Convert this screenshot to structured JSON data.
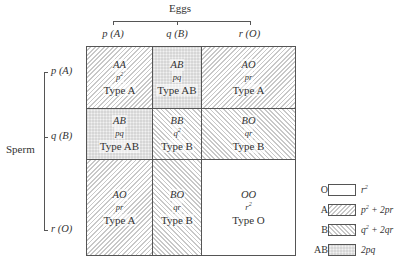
{
  "header": {
    "eggs_label": "Eggs",
    "columns": [
      {
        "freq": "p",
        "allele": "(A)"
      },
      {
        "freq": "q",
        "allele": "(B)"
      },
      {
        "freq": "r",
        "allele": "(O)"
      }
    ]
  },
  "sperm": {
    "label": "Sperm",
    "rows": [
      {
        "freq": "p",
        "allele": "(A)"
      },
      {
        "freq": "q",
        "allele": "(B)"
      },
      {
        "freq": "r",
        "allele": "(O)"
      }
    ]
  },
  "grid": {
    "cells": [
      [
        {
          "genotype": "AA",
          "freq_base": "p",
          "freq_sup": "2",
          "type": "Type A",
          "pattern": "A"
        },
        {
          "genotype": "AB",
          "freq_base": "pq",
          "freq_sup": "",
          "type": "Type AB",
          "pattern": "AB"
        },
        {
          "genotype": "AO",
          "freq_base": "pr",
          "freq_sup": "",
          "type": "Type A",
          "pattern": "A"
        }
      ],
      [
        {
          "genotype": "AB",
          "freq_base": "pq",
          "freq_sup": "",
          "type": "Type AB",
          "pattern": "AB"
        },
        {
          "genotype": "BB",
          "freq_base": "q",
          "freq_sup": "2",
          "type": "Type B",
          "pattern": "B"
        },
        {
          "genotype": "BO",
          "freq_base": "qr",
          "freq_sup": "",
          "type": "Type B",
          "pattern": "B"
        }
      ],
      [
        {
          "genotype": "AO",
          "freq_base": "pr",
          "freq_sup": "",
          "type": "Type A",
          "pattern": "A"
        },
        {
          "genotype": "BO",
          "freq_base": "qr",
          "freq_sup": "",
          "type": "Type B",
          "pattern": "B"
        },
        {
          "genotype": "OO",
          "freq_base": "r",
          "freq_sup": "2",
          "type": "Type O",
          "pattern": "O"
        }
      ]
    ]
  },
  "legend": {
    "items": [
      {
        "key": "O",
        "pattern": "O",
        "formula_parts": [
          "r",
          "2",
          ""
        ]
      },
      {
        "key": "A",
        "pattern": "A",
        "formula_parts": [
          "p",
          "2",
          " + 2pr"
        ]
      },
      {
        "key": "B",
        "pattern": "B",
        "formula_parts": [
          "q",
          "2",
          " + 2qr"
        ]
      },
      {
        "key": "AB",
        "pattern": "AB",
        "formula_parts": [
          "2pq",
          "",
          ""
        ]
      }
    ]
  }
}
